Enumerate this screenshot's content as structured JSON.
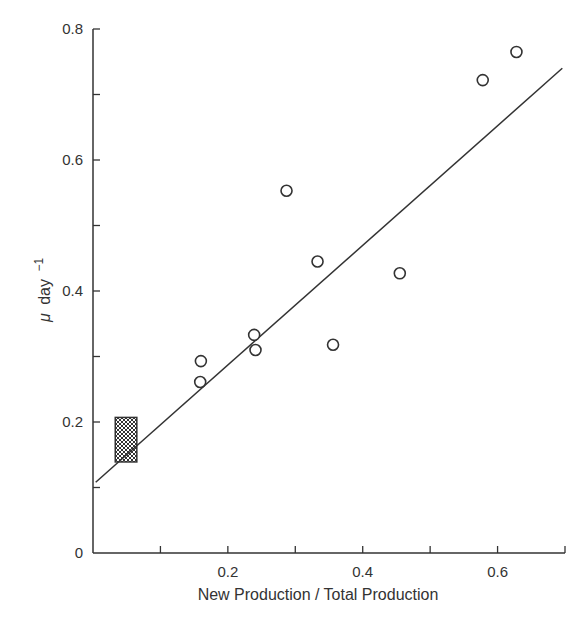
{
  "chart_data": {
    "type": "scatter",
    "title": "",
    "xlabel": "New Production / Total Production",
    "ylabel": "μ day⁻¹",
    "ylabel_parts": {
      "symbol": "μ",
      "unit": "day",
      "exponent": "−1"
    },
    "xlim": [
      0,
      0.7
    ],
    "ylim": [
      0,
      0.8
    ],
    "x_ticks": [
      0,
      0.1,
      0.2,
      0.3,
      0.4,
      0.5,
      0.6,
      0.7
    ],
    "x_tick_labels": [
      "",
      "",
      "0.2",
      "",
      "0.4",
      "",
      "0.6",
      ""
    ],
    "y_ticks": [
      0,
      0.1,
      0.2,
      0.3,
      0.4,
      0.5,
      0.6,
      0.7,
      0.8
    ],
    "y_tick_labels": [
      "0",
      "",
      "0.2",
      "",
      "0.4",
      "",
      "0.6",
      "",
      "0.8"
    ],
    "grid": false,
    "legend": null,
    "series": [
      {
        "name": "observations",
        "marker": "open-circle",
        "points": [
          {
            "x": 0.159,
            "y": 0.261
          },
          {
            "x": 0.16,
            "y": 0.293
          },
          {
            "x": 0.239,
            "y": 0.333
          },
          {
            "x": 0.241,
            "y": 0.31
          },
          {
            "x": 0.287,
            "y": 0.553
          },
          {
            "x": 0.333,
            "y": 0.445
          },
          {
            "x": 0.356,
            "y": 0.318
          },
          {
            "x": 0.455,
            "y": 0.427
          },
          {
            "x": 0.578,
            "y": 0.722
          },
          {
            "x": 0.628,
            "y": 0.765
          }
        ]
      }
    ],
    "regression_line": {
      "x0": 0.004,
      "y0": 0.108,
      "x1": 0.696,
      "y1": 0.74
    },
    "shaded_region": {
      "x_min": 0.033,
      "x_max": 0.065,
      "y_min": 0.139,
      "y_max": 0.207,
      "fill": "cross-hatched"
    }
  },
  "colors": {
    "ink": "#333333",
    "background": "#ffffff"
  }
}
